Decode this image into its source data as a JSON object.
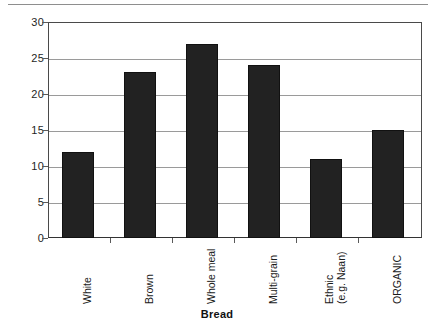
{
  "figure": {
    "page_rule": "",
    "background_color": "#ffffff",
    "bar_color": "#222222",
    "grid_color": "#9a9a9a",
    "axis_color": "#4a4a4a"
  },
  "chart_data": {
    "type": "bar",
    "title": "",
    "xlabel": "Bread",
    "ylabel": "% with residues",
    "categories": [
      "White",
      "Brown",
      "Whole meal",
      "Multi-grain",
      "Ethnic\n(e.g. Naan)",
      "ORGANIC"
    ],
    "values": [
      12,
      23,
      27,
      24,
      11,
      15
    ],
    "ylim": [
      0,
      30
    ],
    "ytick_labels": [
      "0",
      "5",
      "10",
      "15",
      "20",
      "25",
      "30"
    ],
    "ytick_values": [
      0,
      5,
      10,
      15,
      20,
      25,
      30
    ],
    "grid": "horizontal",
    "legend": "none"
  }
}
